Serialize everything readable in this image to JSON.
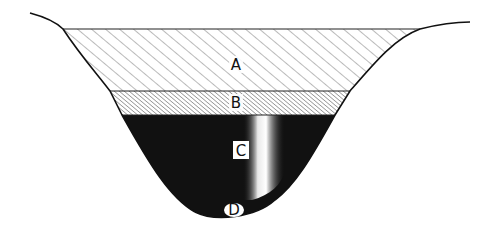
{
  "diagram": {
    "title": "",
    "layers": [
      {
        "id": "A",
        "label": "A",
        "pattern": "wide-diagonal-hatch"
      },
      {
        "id": "B",
        "label": "B",
        "pattern": "dense-diagonal-hatch"
      },
      {
        "id": "C",
        "label": "C",
        "pattern": "solid-black"
      },
      {
        "id": "D",
        "label": "D",
        "pattern": "solid-black"
      }
    ],
    "colors": {
      "ink": "#111111",
      "background": "#ffffff",
      "hatch": "#555555"
    }
  }
}
